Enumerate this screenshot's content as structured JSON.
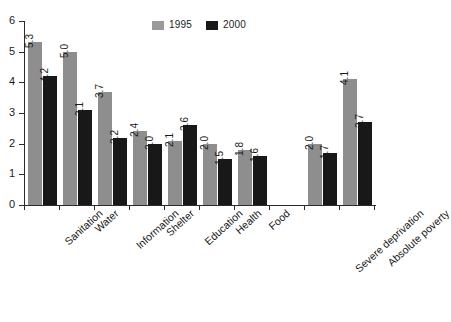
{
  "chart_data": {
    "type": "bar",
    "title": "",
    "subtitle": "",
    "xlabel": "",
    "ylabel": "",
    "ylim": [
      0,
      6
    ],
    "y_ticks": [
      "0",
      "1",
      "2",
      "3",
      "4",
      "5",
      "6"
    ],
    "grid": false,
    "legend_position": "top-center",
    "categories": [
      "Sanitation",
      "Water",
      "Information",
      "Shelter",
      "Education",
      "Health",
      "Food",
      "",
      "Severe deprivation",
      "Absolute poverty"
    ],
    "series": [
      {
        "name": "1995",
        "color": "#8e8e8e",
        "values": [
          5.3,
          5.0,
          3.7,
          2.4,
          2.1,
          2.0,
          1.8,
          null,
          2.0,
          4.1
        ],
        "labels": [
          "5.3",
          "5.0",
          "3.7",
          "2.4",
          "2.1",
          "2.0",
          "1.8",
          "",
          "2.0",
          "4.1"
        ]
      },
      {
        "name": "2000",
        "color": "#181818",
        "values": [
          4.2,
          3.1,
          2.2,
          2.0,
          2.6,
          1.5,
          1.6,
          null,
          1.7,
          2.7
        ],
        "labels": [
          "4.2",
          "3.1",
          "2.2",
          "2.0",
          "2.6",
          "1.5",
          "1.6",
          "",
          "1.7",
          "2.7"
        ]
      }
    ]
  },
  "legend": {
    "entries": [
      {
        "label": "1995",
        "color": "#9a9a9a"
      },
      {
        "label": "2000",
        "color": "#181818"
      }
    ]
  },
  "colors": {
    "series_1995": "#8e8e8e",
    "series_2000": "#181818",
    "axis": "#2b2b2b",
    "text": "#1b1b1b",
    "background": "#ffffff"
  }
}
